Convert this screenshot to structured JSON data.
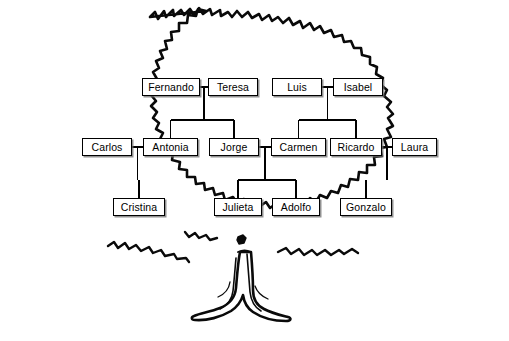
{
  "illustration": {
    "name": "oak-tree-drawing",
    "description": "Hand-drawn oak tree with jagged leafy canopy outline and flared trunk with roots",
    "line_color": "#000000",
    "fill_color": "#ffffff"
  },
  "diagram": {
    "box_style": {
      "border_color": "#000000",
      "background": "#ffffff",
      "shadow_color": "#6e6e6e",
      "text_color": "#000000"
    },
    "connector_color": "#000000",
    "generations": [
      {
        "id": "generation-1",
        "people": [
          {
            "id": "fernando",
            "label": "Fernando",
            "x": 142,
            "y": 78,
            "w": 58
          },
          {
            "id": "teresa",
            "label": "Teresa",
            "x": 208,
            "y": 78,
            "w": 50
          },
          {
            "id": "luis",
            "label": "Luis",
            "x": 272,
            "y": 78,
            "w": 50
          },
          {
            "id": "isabel",
            "label": "Isabel",
            "x": 333,
            "y": 78,
            "w": 50
          }
        ]
      },
      {
        "id": "generation-2",
        "people": [
          {
            "id": "carlos",
            "label": "Carlos",
            "x": 82,
            "y": 138,
            "w": 50
          },
          {
            "id": "antonia",
            "label": "Antonia",
            "x": 143,
            "y": 138,
            "w": 55
          },
          {
            "id": "jorge",
            "label": "Jorge",
            "x": 209,
            "y": 138,
            "w": 50
          },
          {
            "id": "carmen",
            "label": "Carmen",
            "x": 271,
            "y": 138,
            "w": 55
          },
          {
            "id": "ricardo",
            "label": "Ricardo",
            "x": 330,
            "y": 138,
            "w": 52
          },
          {
            "id": "laura",
            "label": "Laura",
            "x": 392,
            "y": 138,
            "w": 45
          }
        ]
      },
      {
        "id": "generation-3",
        "people": [
          {
            "id": "cristina",
            "label": "Cristina",
            "x": 113,
            "y": 198,
            "w": 52
          },
          {
            "id": "julieta",
            "label": "Julieta",
            "x": 214,
            "y": 198,
            "w": 48
          },
          {
            "id": "adolfo",
            "label": "Adolfo",
            "x": 272,
            "y": 198,
            "w": 48
          },
          {
            "id": "gonzalo",
            "label": "Gonzalo",
            "x": 340,
            "y": 198,
            "w": 52
          }
        ]
      }
    ],
    "marriages": [
      {
        "id": "marriage-fernando-teresa",
        "spouse_a": "fernando",
        "spouse_b": "teresa",
        "children": [
          "antonia",
          "jorge"
        ]
      },
      {
        "id": "marriage-luis-isabel",
        "spouse_a": "luis",
        "spouse_b": "isabel",
        "children": [
          "carmen",
          "ricardo"
        ]
      },
      {
        "id": "marriage-carlos-antonia",
        "spouse_a": "carlos",
        "spouse_b": "antonia",
        "children": [
          "cristina"
        ]
      },
      {
        "id": "marriage-jorge-carmen",
        "spouse_a": "jorge",
        "spouse_b": "carmen",
        "children": [
          "julieta",
          "adolfo"
        ]
      },
      {
        "id": "marriage-ricardo-laura",
        "spouse_a": "ricardo",
        "spouse_b": "laura",
        "children": [
          "gonzalo"
        ]
      }
    ]
  }
}
